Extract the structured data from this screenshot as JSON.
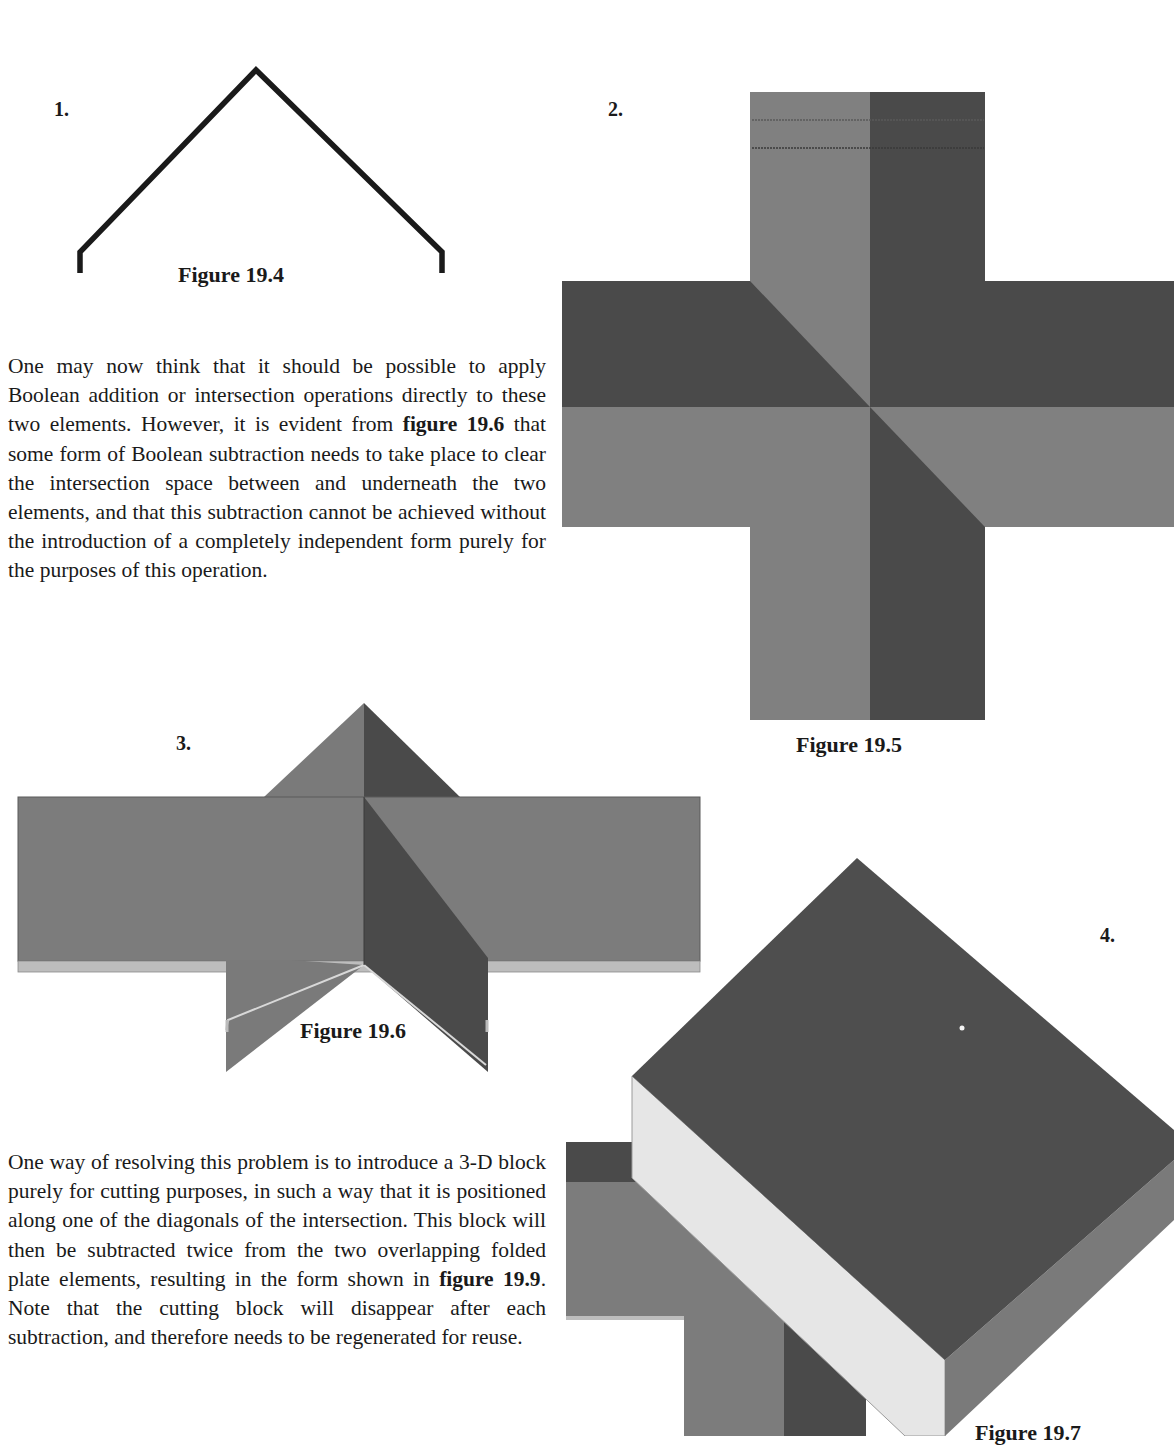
{
  "page": {
    "top_cutoff_text": "...p...g...",
    "paragraphs": [
      {
        "id": "para-1",
        "segments": [
          {
            "text": "One may now think that it should be possible to apply Boolean addition or intersection operations directly to these two elements. However, it is evident from ",
            "bold": false
          },
          {
            "text": "figure 19.6",
            "bold": true
          },
          {
            "text": " that some form of Boolean subtraction needs to take place to clear the intersection space between and underneath the two elements, and that this subtraction cannot be achieved without the introduction of a com­pletely independent form purely for the purposes of this operation.",
            "bold": false
          }
        ]
      },
      {
        "id": "para-2",
        "segments": [
          {
            "text": "One way of resolving this problem is to introduce a 3-D block purely for cutting purposes, in such a way that it is positioned along one of the diagonals of the intersection. This block will then be subtracted twice from the two overlapping folded plate ele­ments, resulting in the form shown in ",
            "bold": false
          },
          {
            "text": "figure 19.9",
            "bold": true
          },
          {
            "text": ". Note that the cutting block will disappear after each subtraction, and therefore needs to be regenerated for reuse.",
            "bold": false
          }
        ]
      }
    ],
    "figures": [
      {
        "number_label": "1.",
        "caption": "Figure 19.4",
        "description": "Folded plate profile (inverted V with vertical feet)"
      },
      {
        "number_label": "2.",
        "caption": "Figure 19.5",
        "description": "Plan view of two intersecting folded plates forming a cross"
      },
      {
        "number_label": "3.",
        "caption": "Figure 19.6",
        "description": "Elevation of overlapping folded plate elements"
      },
      {
        "number_label": "4.",
        "caption": "Figure 19.7",
        "description": "3-D cutting block positioned along the diagonal of the intersection"
      }
    ],
    "colors": {
      "light_face": "#808080",
      "dark_face": "#4a4a4a",
      "mid_face": "#6e6e6e",
      "pale_face": "#e6e6e6",
      "edge_strip": "#bdbdbd",
      "line": "#1a1a1a"
    }
  }
}
